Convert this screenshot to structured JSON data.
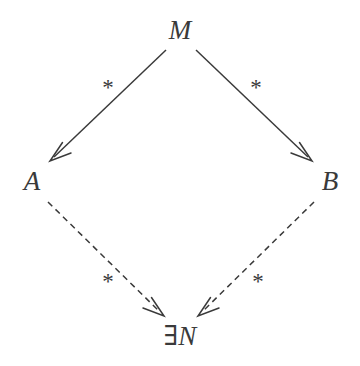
{
  "diagram": {
    "type": "commutative-diagram",
    "shape": "diamond",
    "background_color": "#ffffff",
    "stroke_color": "#3a3a3a",
    "nodes": [
      {
        "id": "M",
        "label": "M",
        "position": "top",
        "x": 180,
        "y": 30
      },
      {
        "id": "A",
        "label": "A",
        "position": "left",
        "x": 32,
        "y": 181
      },
      {
        "id": "B",
        "label": "B",
        "position": "right",
        "x": 330,
        "y": 181
      },
      {
        "id": "N",
        "label": "∃N",
        "quantifier": "∃",
        "variable": "N",
        "position": "bottom",
        "x": 180,
        "y": 336
      }
    ],
    "edges": [
      {
        "id": "M-to-A",
        "from": "M",
        "to": "A",
        "label": "*",
        "style": "solid",
        "arrowhead": "open-v",
        "label_x": 108,
        "label_y": 87
      },
      {
        "id": "M-to-B",
        "from": "M",
        "to": "B",
        "label": "*",
        "style": "solid",
        "arrowhead": "open-v",
        "label_x": 256,
        "label_y": 87
      },
      {
        "id": "A-to-N",
        "from": "A",
        "to": "N",
        "label": "*",
        "style": "dashed",
        "arrowhead": "open-v",
        "label_x": 108,
        "label_y": 281
      },
      {
        "id": "B-to-N",
        "from": "B",
        "to": "N",
        "label": "*",
        "style": "dashed",
        "arrowhead": "open-v",
        "label_x": 258,
        "label_y": 281
      }
    ]
  }
}
